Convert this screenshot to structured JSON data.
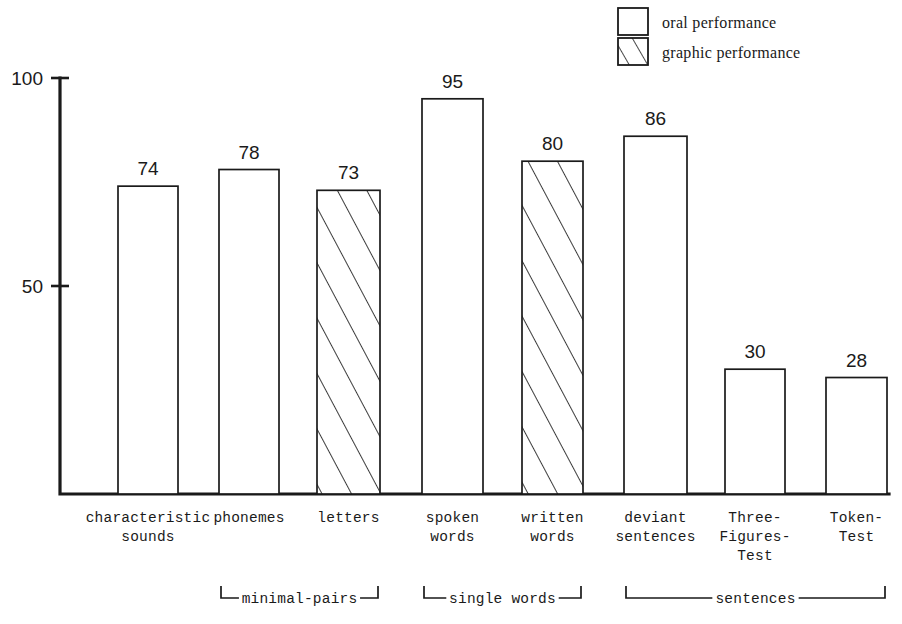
{
  "chart_data": {
    "type": "bar",
    "title": "",
    "xlabel": "",
    "ylabel": "",
    "ylim": [
      0,
      100
    ],
    "yticks": [
      50,
      100
    ],
    "ytick_labels": [
      "50",
      "100"
    ],
    "grid": false,
    "legend_position": "top-right",
    "categories": [
      "characteristic sounds",
      "phonemes",
      "letters",
      "spoken words",
      "written words",
      "deviant sentences",
      "Three-Figures-Test",
      "Token-Test"
    ],
    "values": [
      74,
      78,
      73,
      95,
      80,
      86,
      30,
      28
    ],
    "series": [
      {
        "name": "oral performance",
        "fill": "outline",
        "values": [
          74,
          78,
          null,
          95,
          null,
          86,
          30,
          28
        ]
      },
      {
        "name": "graphic performance",
        "fill": "hatched",
        "values": [
          null,
          null,
          73,
          null,
          80,
          null,
          null,
          null
        ]
      }
    ]
  },
  "legend": {
    "items": [
      {
        "label": "oral performance",
        "swatch": "outline"
      },
      {
        "label": "graphic performance",
        "swatch": "hatched"
      }
    ]
  },
  "axis": {
    "y_labels": [
      {
        "text": "100",
        "value": 100
      },
      {
        "text": "50",
        "value": 50
      }
    ]
  },
  "bars": [
    {
      "value_label": "74",
      "value": 74,
      "style": "outline",
      "label_lines": [
        "characteristic",
        "sounds"
      ],
      "x": 118,
      "w": 60
    },
    {
      "value_label": "78",
      "value": 78,
      "style": "outline",
      "label_lines": [
        "phonemes"
      ],
      "x": 219,
      "w": 60
    },
    {
      "value_label": "73",
      "value": 73,
      "style": "hatched",
      "label_lines": [
        "letters"
      ],
      "x": 317,
      "w": 63
    },
    {
      "value_label": "95",
      "value": 95,
      "style": "outline",
      "label_lines": [
        "spoken",
        "words"
      ],
      "x": 422,
      "w": 61
    },
    {
      "value_label": "80",
      "value": 80,
      "style": "hatched",
      "label_lines": [
        "written",
        "words"
      ],
      "x": 522,
      "w": 61
    },
    {
      "value_label": "86",
      "value": 86,
      "style": "outline",
      "label_lines": [
        "deviant",
        "sentences"
      ],
      "x": 624,
      "w": 63
    },
    {
      "value_label": "30",
      "value": 30,
      "style": "outline",
      "label_lines": [
        "Three-",
        "Figures-",
        "Test"
      ],
      "x": 725,
      "w": 60
    },
    {
      "value_label": "28",
      "value": 28,
      "style": "outline",
      "label_lines": [
        "Token-",
        "Test"
      ],
      "x": 826,
      "w": 61
    }
  ],
  "groups": [
    {
      "label": "minimal-pairs",
      "from_bar": 1,
      "to_bar": 2
    },
    {
      "label": "single words",
      "from_bar": 3,
      "to_bar": 4
    },
    {
      "label": "sentences",
      "from_bar": 5,
      "to_bar": 7
    }
  ],
  "colors": {
    "ink": "#1a1a1a",
    "background": "#ffffff"
  }
}
